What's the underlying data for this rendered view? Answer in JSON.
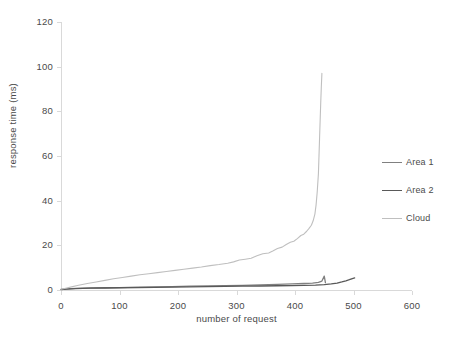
{
  "chart_data": {
    "type": "line",
    "title": "",
    "xlabel": "number of request",
    "ylabel": "response time (ms)",
    "xlim": [
      0,
      600
    ],
    "ylim": [
      0,
      120
    ],
    "xticks": [
      0,
      100,
      200,
      300,
      400,
      500,
      600
    ],
    "yticks": [
      0,
      20,
      40,
      60,
      80,
      100,
      120
    ],
    "grid": false,
    "legend_position": "right",
    "series": [
      {
        "name": "Area 1",
        "color": "#808080",
        "x": [
          0,
          10,
          25,
          50,
          75,
          100,
          130,
          160,
          190,
          220,
          250,
          280,
          310,
          340,
          370,
          395,
          415,
          430,
          440,
          446,
          450,
          452
        ],
        "y": [
          0.3,
          0.5,
          0.7,
          0.9,
          1.0,
          1.1,
          1.3,
          1.4,
          1.5,
          1.7,
          1.8,
          2.0,
          2.1,
          2.3,
          2.5,
          2.7,
          2.9,
          3.1,
          3.4,
          4.0,
          6.2,
          3.3
        ]
      },
      {
        "name": "Area 2",
        "color": "#595959",
        "x": [
          0,
          10,
          25,
          50,
          75,
          100,
          130,
          160,
          190,
          220,
          250,
          280,
          310,
          340,
          370,
          395,
          415,
          435,
          450,
          462,
          472,
          480,
          487,
          493,
          498,
          502
        ],
        "y": [
          0.2,
          0.4,
          0.6,
          0.8,
          0.9,
          1.0,
          1.1,
          1.2,
          1.3,
          1.4,
          1.5,
          1.6,
          1.7,
          1.8,
          1.9,
          2.0,
          2.1,
          2.2,
          2.4,
          2.7,
          3.1,
          3.6,
          4.1,
          4.6,
          5.1,
          5.4
        ]
      },
      {
        "name": "Cloud",
        "color": "#bfbfbf",
        "x": [
          0,
          8,
          18,
          30,
          45,
          60,
          75,
          90,
          105,
          120,
          135,
          150,
          165,
          180,
          195,
          210,
          225,
          240,
          255,
          270,
          285,
          295,
          305,
          315,
          325,
          335,
          345,
          355,
          362,
          370,
          378,
          385,
          392,
          398,
          404,
          410,
          415,
          420,
          424,
          428,
          431,
          434,
          436,
          438,
          440,
          441,
          442,
          443,
          444,
          445,
          446
        ],
        "y": [
          0.3,
          0.8,
          1.4,
          2.1,
          2.9,
          3.6,
          4.3,
          5.0,
          5.6,
          6.2,
          6.8,
          7.3,
          7.8,
          8.3,
          8.8,
          9.3,
          9.8,
          10.3,
          10.9,
          11.4,
          12.0,
          12.6,
          13.4,
          13.8,
          14.2,
          15.3,
          16.2,
          16.6,
          17.5,
          18.6,
          19.2,
          20.4,
          21.4,
          21.8,
          23.0,
          24.4,
          25.0,
          26.3,
          27.6,
          29.0,
          31.0,
          34.0,
          38.0,
          44.0,
          52.0,
          60.0,
          68.0,
          76.0,
          84.0,
          91.0,
          97.0
        ]
      }
    ]
  },
  "legend": {
    "items": [
      {
        "label": "Area 1"
      },
      {
        "label": "Area 2"
      },
      {
        "label": "Cloud"
      }
    ]
  },
  "axes": {
    "y_title": "response time (ms)",
    "x_title": "number of request",
    "y_tick_labels": [
      "0",
      "20",
      "40",
      "60",
      "80",
      "100",
      "120"
    ],
    "x_tick_labels": [
      "0",
      "100",
      "200",
      "300",
      "400",
      "500",
      "600"
    ]
  },
  "colors": {
    "axis": "#d9d9d9",
    "text": "#4a4a4a",
    "area1": "#808080",
    "area2": "#595959",
    "cloud": "#bfbfbf",
    "background": "#ffffff"
  }
}
